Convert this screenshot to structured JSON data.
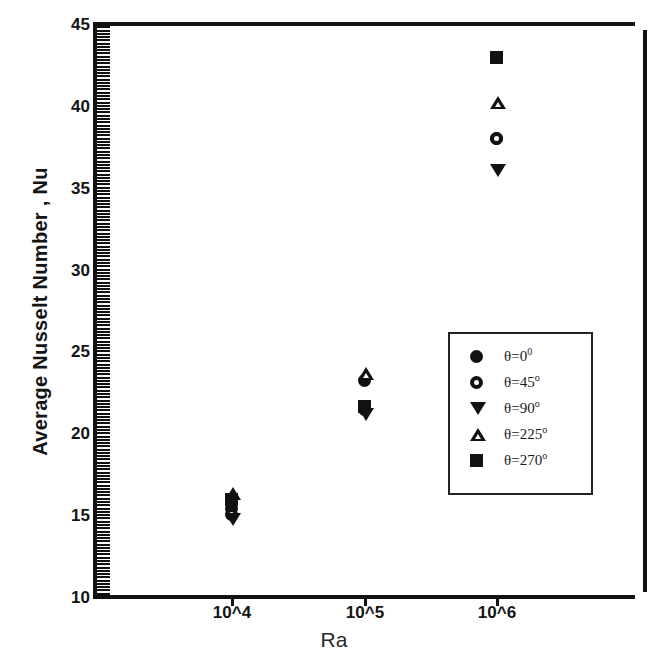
{
  "chart_data": {
    "type": "scatter",
    "title": "",
    "xlabel": "Ra",
    "ylabel": "Average Nusselt Number , Nu",
    "categories": [
      "10^4",
      "10^5",
      "10^6"
    ],
    "xticklabels": [
      "10^4",
      "10^5",
      "10^6"
    ],
    "yticklabels": [
      "10",
      "15",
      "20",
      "25",
      "30",
      "35",
      "40",
      "45"
    ],
    "ylim": [
      10,
      45
    ],
    "ytick_step": 5,
    "yminor_tick_step": 0.2,
    "grid": false,
    "legend_position": "center-right inside axes",
    "marker_color": "#111111",
    "series": [
      {
        "name": "θ=0°",
        "marker": "filled-circle",
        "x": [
          "10^4",
          "10^5",
          "10^6"
        ],
        "values": [
          15.4,
          23.2,
          38.0
        ]
      },
      {
        "name": "θ=45°",
        "marker": "open-circle",
        "x": [
          "10^4",
          "10^5",
          "10^6"
        ],
        "values": [
          15.0,
          21.4,
          38.0
        ]
      },
      {
        "name": "θ=90°",
        "marker": "filled-triangle-down",
        "x": [
          "10^4",
          "10^5",
          "10^6"
        ],
        "values": [
          14.7,
          21.1,
          36.0
        ]
      },
      {
        "name": "θ=225°",
        "marker": "open-triangle-up",
        "x": [
          "10^4",
          "10^5",
          "10^6"
        ],
        "values": [
          16.3,
          23.6,
          40.2
        ]
      },
      {
        "name": "θ=270°",
        "marker": "filled-square",
        "x": [
          "10^4",
          "10^5",
          "10^6"
        ],
        "values": [
          15.9,
          21.6,
          42.9
        ]
      }
    ]
  },
  "axes": {
    "y_title": "Average Nusselt Number , Nu",
    "x_title": "Ra",
    "y_ticks": [
      {
        "label": "45"
      },
      {
        "label": "40"
      },
      {
        "label": "35"
      },
      {
        "label": "30"
      },
      {
        "label": "25"
      },
      {
        "label": "20"
      },
      {
        "label": "15"
      },
      {
        "label": "10"
      }
    ],
    "x_ticks": [
      {
        "label": "10^4"
      },
      {
        "label": "10^5"
      },
      {
        "label": "10^6"
      }
    ]
  },
  "legend": {
    "entries": [
      {
        "symbol": "filled-circle",
        "base": "θ=0",
        "sup": "0"
      },
      {
        "symbol": "open-circle",
        "base": "θ=45",
        "sup": "o"
      },
      {
        "symbol": "filled-triangle-down",
        "base": "θ=90",
        "sup": "o"
      },
      {
        "symbol": "open-triangle-up",
        "base": "θ=225",
        "sup": "o"
      },
      {
        "symbol": "filled-square",
        "base": "θ=270",
        "sup": "o"
      }
    ]
  },
  "colors": {
    "ink": "#111111",
    "background": "#ffffff"
  }
}
